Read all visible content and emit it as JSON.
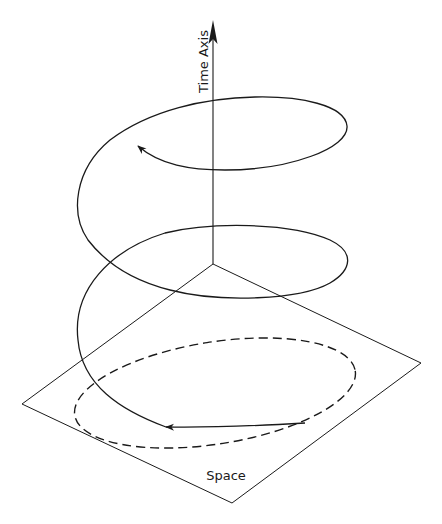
{
  "figure": {
    "time_axis_label": "Time Axis",
    "space_label": "Space",
    "colors": {
      "line": "#1a1a1a",
      "background": "#ffffff"
    }
  }
}
